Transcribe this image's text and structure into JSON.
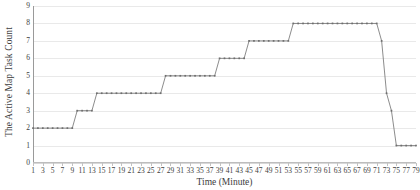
{
  "chart_data": {
    "type": "line",
    "title": "",
    "xlabel": "Time (Minute)",
    "ylabel": "The Active Map Task Count",
    "xlim": [
      1,
      79
    ],
    "ylim": [
      0,
      9
    ],
    "grid": true,
    "legend": false,
    "marker": "square",
    "line_color": "#6e6e6e",
    "grid_color": "#e9e9e9",
    "axis_color": "#9a9a9a",
    "y_ticks": [
      0,
      1,
      2,
      3,
      4,
      5,
      6,
      7,
      8,
      9
    ],
    "x_ticks": [
      1,
      3,
      5,
      7,
      9,
      11,
      13,
      15,
      17,
      19,
      21,
      23,
      25,
      27,
      29,
      31,
      33,
      35,
      37,
      39,
      41,
      43,
      45,
      47,
      49,
      51,
      53,
      55,
      57,
      59,
      61,
      63,
      65,
      67,
      69,
      71,
      73,
      75,
      77,
      79
    ],
    "x": [
      1,
      2,
      3,
      4,
      5,
      6,
      7,
      8,
      9,
      10,
      11,
      12,
      13,
      14,
      15,
      16,
      17,
      18,
      19,
      20,
      21,
      22,
      23,
      24,
      25,
      26,
      27,
      28,
      29,
      30,
      31,
      32,
      33,
      34,
      35,
      36,
      37,
      38,
      39,
      40,
      41,
      42,
      43,
      44,
      45,
      46,
      47,
      48,
      49,
      50,
      51,
      52,
      53,
      54,
      55,
      56,
      57,
      58,
      59,
      60,
      61,
      62,
      63,
      64,
      65,
      66,
      67,
      68,
      69,
      70,
      71,
      72,
      73,
      74,
      75,
      76,
      77,
      78,
      79
    ],
    "values": [
      2,
      2,
      2,
      2,
      2,
      2,
      2,
      2,
      2,
      3,
      3,
      3,
      3,
      4,
      4,
      4,
      4,
      4,
      4,
      4,
      4,
      4,
      4,
      4,
      4,
      4,
      4,
      5,
      5,
      5,
      5,
      5,
      5,
      5,
      5,
      5,
      5,
      5,
      6,
      6,
      6,
      6,
      6,
      6,
      7,
      7,
      7,
      7,
      7,
      7,
      7,
      7,
      7,
      8,
      8,
      8,
      8,
      8,
      8,
      8,
      8,
      8,
      8,
      8,
      8,
      8,
      8,
      8,
      8,
      8,
      8,
      7,
      4,
      3,
      1,
      1,
      1,
      1,
      1
    ]
  }
}
